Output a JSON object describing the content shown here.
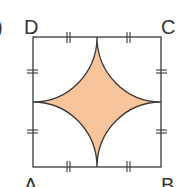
{
  "figure": {
    "part_label": ")",
    "vertices": {
      "A": "A",
      "B": "B",
      "C": "C",
      "D": "D"
    },
    "colors": {
      "fill": "#f7c49b",
      "stroke": "#3a3a3a",
      "text": "#333333"
    }
  }
}
